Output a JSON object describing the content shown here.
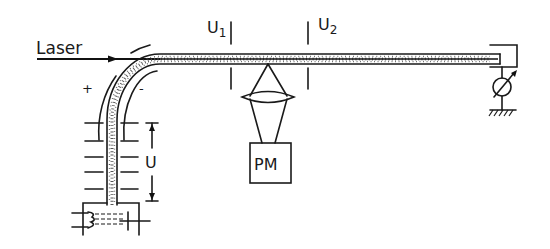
{
  "diagram": {
    "type": "schematic",
    "labels": {
      "laser": "Laser",
      "plus": "+",
      "minus": "-",
      "u1_main": "U",
      "u1_sub": "1",
      "u2_main": "U",
      "u2_sub": "2",
      "u_voltage": "U",
      "pm": "PM"
    },
    "components": [
      {
        "id": "laser-beam",
        "label": "Laser",
        "kind": "arrow"
      },
      {
        "id": "bent-tube",
        "kind": "capillary-with-particles"
      },
      {
        "id": "deflector-plus",
        "label": "+",
        "kind": "arc-electrode"
      },
      {
        "id": "deflector-minus",
        "label": "-",
        "kind": "arc-electrode"
      },
      {
        "id": "electrode-u1",
        "label": "U1",
        "kind": "plate-pair"
      },
      {
        "id": "electrode-u2",
        "label": "U2",
        "kind": "plate-pair"
      },
      {
        "id": "lens",
        "kind": "convex-lens"
      },
      {
        "id": "photomultiplier",
        "label": "PM",
        "kind": "box"
      },
      {
        "id": "column-plates",
        "count": 5,
        "kind": "plate-stack"
      },
      {
        "id": "voltage-dimension",
        "label": "U",
        "kind": "dimension-arrow"
      },
      {
        "id": "reservoir",
        "kind": "liquid-container"
      },
      {
        "id": "heater-coil",
        "kind": "coil"
      },
      {
        "id": "meter",
        "kind": "adjustable-meter"
      },
      {
        "id": "ground",
        "kind": "ground-symbol"
      }
    ],
    "edges": [
      {
        "from": "laser-beam",
        "to": "bent-tube"
      },
      {
        "from": "bent-tube",
        "to": "electrode-u1"
      },
      {
        "from": "electrode-u1",
        "to": "electrode-u2"
      },
      {
        "from": "bent-tube",
        "to": "lens"
      },
      {
        "from": "lens",
        "to": "photomultiplier"
      },
      {
        "from": "bent-tube",
        "to": "meter"
      },
      {
        "from": "meter",
        "to": "ground"
      },
      {
        "from": "reservoir",
        "to": "bent-tube"
      }
    ]
  }
}
